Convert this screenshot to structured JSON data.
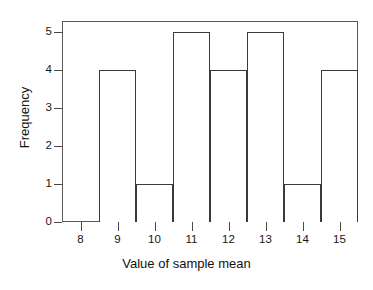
{
  "chart_data": {
    "type": "bar",
    "title": "",
    "xlabel": "Value of sample mean",
    "ylabel": "Frequency",
    "categories": [
      "9",
      "10",
      "11",
      "12",
      "13",
      "14",
      "15"
    ],
    "values": [
      4,
      1,
      5,
      4,
      5,
      1,
      4
    ],
    "bin_edges": [
      8.5,
      9.5,
      10.5,
      11.5,
      12.5,
      13.5,
      14.5,
      15.5
    ],
    "x_tick_labels": [
      "8",
      "9",
      "10",
      "11",
      "12",
      "13",
      "14",
      "15"
    ],
    "x_tick_values": [
      8,
      9,
      10,
      11,
      12,
      13,
      14,
      15
    ],
    "y_tick_labels": [
      "0",
      "1",
      "2",
      "3",
      "4",
      "5"
    ],
    "y_tick_values": [
      0,
      1,
      2,
      3,
      4,
      5
    ],
    "xlim": [
      7.5,
      15.5
    ],
    "ylim": [
      0,
      5.3
    ],
    "grid": false,
    "legend": null,
    "bar_fill": "#ffffff",
    "bar_edge_color": "#3a3a3a",
    "axis_color": "#5a5a5a",
    "background": "#ffffff"
  }
}
